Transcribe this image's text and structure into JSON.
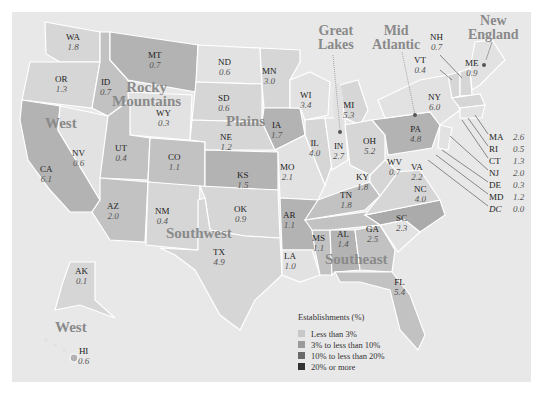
{
  "legend": {
    "title": "Establishments (%)",
    "items": [
      {
        "label": "Less than 3%",
        "color": "#c8c8c8"
      },
      {
        "label": "3% to less than 10%",
        "color": "#9a9a9a"
      },
      {
        "label": "10% to less than 20%",
        "color": "#6a6a6a"
      },
      {
        "label": "20% or more",
        "color": "#333333"
      }
    ]
  },
  "regions": {
    "west": "West",
    "west_offshore": "West",
    "rocky_1": "Rocky",
    "rocky_2": "Mountains",
    "plains": "Plains",
    "southwest": "Southwest",
    "southeast": "Southeast",
    "great_lakes_1": "Great",
    "great_lakes_2": "Lakes",
    "mid_atlantic_1": "Mid",
    "mid_atlantic_2": "Atlantic",
    "new_england_1": "New",
    "new_england_2": "England"
  },
  "states": {
    "WA": {
      "abbr": "WA",
      "value": "1.8"
    },
    "OR": {
      "abbr": "OR",
      "value": "1.3"
    },
    "CA": {
      "abbr": "CA",
      "value": "6.1"
    },
    "NV": {
      "abbr": "NV",
      "value": "0.6"
    },
    "ID": {
      "abbr": "ID",
      "value": "0.7"
    },
    "MT": {
      "abbr": "MT",
      "value": "0.7"
    },
    "WY": {
      "abbr": "WY",
      "value": "0.3"
    },
    "UT": {
      "abbr": "UT",
      "value": "0.4"
    },
    "CO": {
      "abbr": "CO",
      "value": "1.1"
    },
    "AZ": {
      "abbr": "AZ",
      "value": "2.0"
    },
    "NM": {
      "abbr": "NM",
      "value": "0.4"
    },
    "ND": {
      "abbr": "ND",
      "value": "0.6"
    },
    "SD": {
      "abbr": "SD",
      "value": "0.6"
    },
    "NE": {
      "abbr": "NE",
      "value": "1.2"
    },
    "KS": {
      "abbr": "KS",
      "value": "1.5"
    },
    "MN": {
      "abbr": "MN",
      "value": "3.0"
    },
    "IA": {
      "abbr": "IA",
      "value": "1.7"
    },
    "MO": {
      "abbr": "MO",
      "value": "2.1"
    },
    "OK": {
      "abbr": "OK",
      "value": "0.9"
    },
    "TX": {
      "abbr": "TX",
      "value": "4.9"
    },
    "AR": {
      "abbr": "AR",
      "value": "1.1"
    },
    "LA": {
      "abbr": "LA",
      "value": "1.0"
    },
    "WI": {
      "abbr": "WI",
      "value": "3.4"
    },
    "IL": {
      "abbr": "IL",
      "value": "4.0"
    },
    "MI": {
      "abbr": "MI",
      "value": "5.3"
    },
    "IN": {
      "abbr": "IN",
      "value": "2.7"
    },
    "OH": {
      "abbr": "OH",
      "value": "5.2"
    },
    "KY": {
      "abbr": "KY",
      "value": "1.8"
    },
    "TN": {
      "abbr": "TN",
      "value": "1.8"
    },
    "MS": {
      "abbr": "MS",
      "value": "1.1"
    },
    "AL": {
      "abbr": "AL",
      "value": "1.4"
    },
    "GA": {
      "abbr": "GA",
      "value": "2.5"
    },
    "FL": {
      "abbr": "FL",
      "value": "5.4"
    },
    "SC": {
      "abbr": "SC",
      "value": "2.3"
    },
    "NC": {
      "abbr": "NC",
      "value": "4.0"
    },
    "VA": {
      "abbr": "VA",
      "value": "2.2"
    },
    "WV": {
      "abbr": "WV",
      "value": "0.7"
    },
    "PA": {
      "abbr": "PA",
      "value": "4.8"
    },
    "NY": {
      "abbr": "NY",
      "value": "6.0"
    },
    "VT": {
      "abbr": "VT",
      "value": "0.4"
    },
    "NH": {
      "abbr": "NH",
      "value": "0.7"
    },
    "ME": {
      "abbr": "ME",
      "value": "0.9"
    },
    "AK": {
      "abbr": "AK",
      "value": "0.1"
    },
    "HI": {
      "abbr": "HI",
      "value": "0.6"
    }
  },
  "callouts": [
    {
      "abbr": "MA",
      "value": "2.6"
    },
    {
      "abbr": "RI",
      "value": "0.5"
    },
    {
      "abbr": "CT",
      "value": "1.3"
    },
    {
      "abbr": "NJ",
      "value": "2.0"
    },
    {
      "abbr": "DE",
      "value": "0.3"
    },
    {
      "abbr": "MD",
      "value": "1.2"
    },
    {
      "abbr": "DC",
      "value": "0.0"
    }
  ]
}
